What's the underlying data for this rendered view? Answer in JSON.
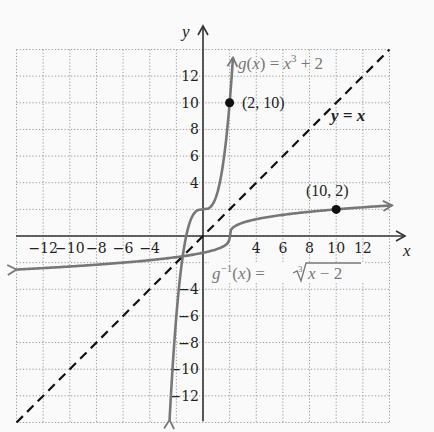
{
  "chart_data": {
    "type": "line",
    "title": "",
    "xlabel": "x",
    "ylabel": "y",
    "xlim": [
      -14,
      14
    ],
    "ylim": [
      -14,
      14
    ],
    "grid": true,
    "grid_style": "dotted",
    "x_ticks": [
      "-12",
      "-10",
      "-8",
      "-6",
      "-4",
      "4",
      "6",
      "8",
      "10",
      "12"
    ],
    "y_ticks": [
      "12",
      "10",
      "8",
      "6",
      "4",
      "-4",
      "-6",
      "-8",
      "-10",
      "-12"
    ],
    "series": [
      {
        "name": "g(x) = x^3 + 2",
        "label_parts": {
          "fn": "g",
          "open": "(",
          "var": "x",
          "close": ") = ",
          "var2": "x",
          "exp": "3",
          "rest": " + 2"
        },
        "style": "solid",
        "color": "#777777",
        "expression": "x^3 + 2",
        "x": [
          -2.5,
          -2,
          -1.5,
          -1,
          -0.5,
          0,
          0.5,
          1,
          1.5,
          2,
          2.2
        ],
        "y": [
          -13.6,
          -6,
          -1.4,
          1,
          1.9,
          2,
          2.1,
          3,
          5.4,
          10,
          12.6
        ]
      },
      {
        "name": "g^-1(x) = cuberoot(x - 2)",
        "label_parts": {
          "fn": "g",
          "sup": "−1",
          "open": "(",
          "var": "x",
          "close": ") = ",
          "root_index": "3",
          "radicand_var": "x",
          "radicand_rest": " − 2"
        },
        "style": "solid",
        "color": "#777777",
        "expression": "(x - 2)^(1/3)",
        "x": [
          -14,
          -6,
          -1,
          1,
          1.9,
          2,
          2.1,
          3,
          5,
          10,
          14
        ],
        "y": [
          -2.5,
          -2,
          -1.44,
          -1,
          -0.46,
          0,
          0.46,
          1,
          1.44,
          2,
          2.29
        ]
      },
      {
        "name": "y = x",
        "label": "y = x",
        "style": "dashed",
        "color": "#111111",
        "x": [
          -14,
          14
        ],
        "y": [
          -14,
          14
        ]
      }
    ],
    "points": [
      {
        "label": "(2, 10)",
        "x": 2,
        "y": 10
      },
      {
        "label": "(10, 2)",
        "x": 10,
        "y": 2
      }
    ],
    "annotations": [
      "g(x) = x³ + 2",
      "g⁻¹(x) = ∛(x − 2)",
      "y = x",
      "(2, 10)",
      "(10, 2)"
    ]
  }
}
